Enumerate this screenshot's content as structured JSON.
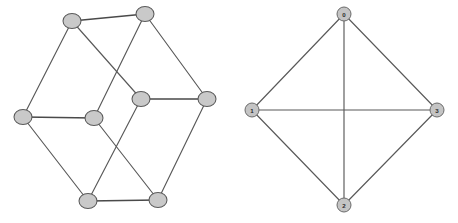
{
  "figure": {
    "background_color": "#ffffff",
    "width": 458,
    "height": 223,
    "node_fill_color": "#c9c9c9",
    "node_stroke_color": "#5a5a5a",
    "edge_color": "#595959",
    "label_color": "#2b2b2b"
  },
  "chart_data": {
    "type": "diagram",
    "subtype": "graph-drawing",
    "title": "",
    "graphs": [
      {
        "id": "left-graph",
        "name": "unlabeled-8-node-graph",
        "node_shape": "ellipse",
        "labels_visible": false,
        "node_count": 8,
        "edge_count": 12,
        "nodes": [
          {
            "id": "L0",
            "label": "",
            "x": 72,
            "y": 21,
            "rx": 9.0,
            "ry": 7.5
          },
          {
            "id": "L1",
            "label": "",
            "x": 145,
            "y": 14,
            "rx": 9.0,
            "ry": 7.5
          },
          {
            "id": "L2",
            "label": "",
            "x": 207,
            "y": 99,
            "rx": 9.0,
            "ry": 7.5
          },
          {
            "id": "L3",
            "label": "",
            "x": 158,
            "y": 200,
            "rx": 9.0,
            "ry": 7.5
          },
          {
            "id": "L4",
            "label": "",
            "x": 88,
            "y": 201,
            "rx": 9.0,
            "ry": 7.5
          },
          {
            "id": "L5",
            "label": "",
            "x": 23,
            "y": 117,
            "rx": 9.0,
            "ry": 7.5
          },
          {
            "id": "L6",
            "label": "",
            "x": 94,
            "y": 118,
            "rx": 9.0,
            "ry": 7.5
          },
          {
            "id": "L7",
            "label": "",
            "x": 141,
            "y": 99,
            "rx": 9.0,
            "ry": 7.5
          }
        ],
        "edges": [
          {
            "source": "L0",
            "target": "L1",
            "style": "thick"
          },
          {
            "source": "L1",
            "target": "L2",
            "style": "thin"
          },
          {
            "source": "L2",
            "target": "L3",
            "style": "thin"
          },
          {
            "source": "L3",
            "target": "L4",
            "style": "thick"
          },
          {
            "source": "L4",
            "target": "L5",
            "style": "thin"
          },
          {
            "source": "L5",
            "target": "L0",
            "style": "thin"
          },
          {
            "source": "L5",
            "target": "L6",
            "style": "thick"
          },
          {
            "source": "L7",
            "target": "L2",
            "style": "thick"
          },
          {
            "source": "L0",
            "target": "L7",
            "style": "thin"
          },
          {
            "source": "L1",
            "target": "L6",
            "style": "thin"
          },
          {
            "source": "L6",
            "target": "L3",
            "style": "thin"
          },
          {
            "source": "L7",
            "target": "L4",
            "style": "thin"
          }
        ]
      },
      {
        "id": "right-graph",
        "name": "labeled-k4-complete-graph",
        "node_shape": "circle",
        "labels_visible": true,
        "node_count": 4,
        "edge_count": 6,
        "nodes": [
          {
            "id": "R0",
            "label": "0",
            "x": 344,
            "y": 14,
            "r": 7.0
          },
          {
            "id": "R1",
            "label": "1",
            "x": 252,
            "y": 110,
            "r": 7.0
          },
          {
            "id": "R2",
            "label": "2",
            "x": 344,
            "y": 205,
            "r": 7.0
          },
          {
            "id": "R3",
            "label": "3",
            "x": 437,
            "y": 110,
            "r": 7.0
          }
        ],
        "edges": [
          {
            "source": "R0",
            "target": "R1",
            "style": "thin"
          },
          {
            "source": "R0",
            "target": "R3",
            "style": "thin"
          },
          {
            "source": "R1",
            "target": "R2",
            "style": "thin"
          },
          {
            "source": "R2",
            "target": "R3",
            "style": "thin"
          },
          {
            "source": "R0",
            "target": "R2",
            "style": "thin"
          },
          {
            "source": "R1",
            "target": "R3",
            "style": "thin"
          }
        ]
      }
    ]
  }
}
